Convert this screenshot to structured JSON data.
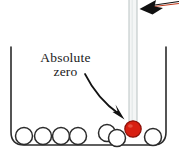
{
  "figure": {
    "width": 179,
    "height": 164,
    "background_color": "#ffffff"
  },
  "annotation": {
    "label_line_1": "Absolute",
    "label_line_2": "zero",
    "text_color": "#1a1a1a",
    "pointer_arrow": {
      "name": "curved-arrow-to-bulb",
      "from_x": 85,
      "from_y": 74,
      "to_x": 123,
      "to_y": 119,
      "color": "#121212"
    }
  },
  "top_arrow": {
    "name": "arrowhead-pointing-to-thermometer",
    "tip_x": 140,
    "tip_y": 8,
    "tail_x": 179,
    "tail_y": 2,
    "color": "#101010",
    "accent_color": "#c23a1c"
  },
  "container": {
    "name": "beaker",
    "left_wall_x": 11,
    "right_wall_x": 166,
    "top_y": 47,
    "bottom_y": 145,
    "corner_radius": 13,
    "stroke_color": "#2b2b2b",
    "stroke_width": 1.6
  },
  "thermometer": {
    "name": "thermometer",
    "tube": {
      "x": 129,
      "y": 0,
      "width": 8,
      "height": 124,
      "fill_color": "#f4f6f6",
      "stroke_color": "#b9c2c2"
    },
    "bulb": {
      "center_x": 133,
      "center_y": 129,
      "radius": 8,
      "fill_color": "#d81f11",
      "stroke_color": "#8c1008"
    }
  },
  "atoms": {
    "stroke_color": "#2b2b2b",
    "fill_color": "#ffffff",
    "radius": 8.5,
    "items": [
      {
        "label": "atom-1",
        "cx": 24,
        "cy": 136
      },
      {
        "label": "atom-2",
        "cx": 43,
        "cy": 136
      },
      {
        "label": "atom-3",
        "cx": 61,
        "cy": 136
      },
      {
        "label": "atom-4",
        "cx": 78,
        "cy": 136
      },
      {
        "label": "atom-5",
        "cx": 107,
        "cy": 133
      },
      {
        "label": "atom-6",
        "cx": 117,
        "cy": 138
      },
      {
        "label": "atom-7",
        "cx": 153,
        "cy": 137
      }
    ]
  }
}
